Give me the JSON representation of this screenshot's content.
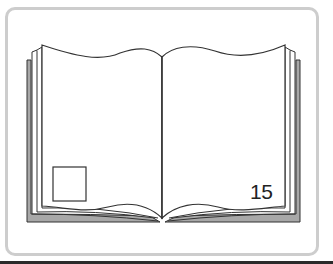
{
  "illustration": {
    "subject": "open-book",
    "page_number": "15",
    "colors": {
      "frame_border": "#cdcdcd",
      "page_edge_fill": "#a8a8a8",
      "line": "#333333",
      "background": "#ffffff",
      "baseline": "#2a2a2a"
    }
  }
}
